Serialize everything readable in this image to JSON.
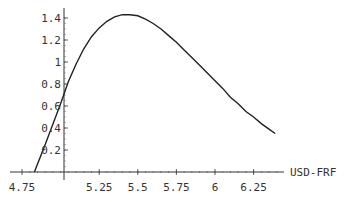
{
  "chart_data": {
    "type": "line",
    "title": "",
    "xlabel": "USD-FRF",
    "ylabel": "",
    "xlim": [
      4.75,
      6.4
    ],
    "ylim": [
      0,
      1.45
    ],
    "grid": false,
    "legend": null,
    "x_ticks": [
      "4.75",
      "5.25",
      "5.5",
      "5.75",
      "6",
      "6.25"
    ],
    "y_ticks": [
      "0.2",
      "0.4",
      "0.6",
      "0.8",
      "1",
      "1.2",
      "1.4"
    ],
    "series": [
      {
        "name": "density",
        "x": [
          4.83,
          4.9,
          5.0,
          5.05,
          5.1,
          5.15,
          5.2,
          5.25,
          5.3,
          5.35,
          5.4,
          5.45,
          5.5,
          5.55,
          5.6,
          5.65,
          5.7,
          5.75,
          5.8,
          5.85,
          5.9,
          5.95,
          6.0,
          6.05,
          6.1,
          6.15,
          6.2,
          6.25,
          6.3,
          6.35,
          6.39
        ],
        "y": [
          0.0,
          0.25,
          0.62,
          0.82,
          0.98,
          1.12,
          1.23,
          1.31,
          1.37,
          1.41,
          1.43,
          1.43,
          1.42,
          1.39,
          1.35,
          1.3,
          1.24,
          1.18,
          1.11,
          1.04,
          0.97,
          0.9,
          0.83,
          0.76,
          0.68,
          0.62,
          0.55,
          0.5,
          0.44,
          0.39,
          0.35
        ]
      }
    ]
  },
  "axis_label_x": "USD-FRF"
}
